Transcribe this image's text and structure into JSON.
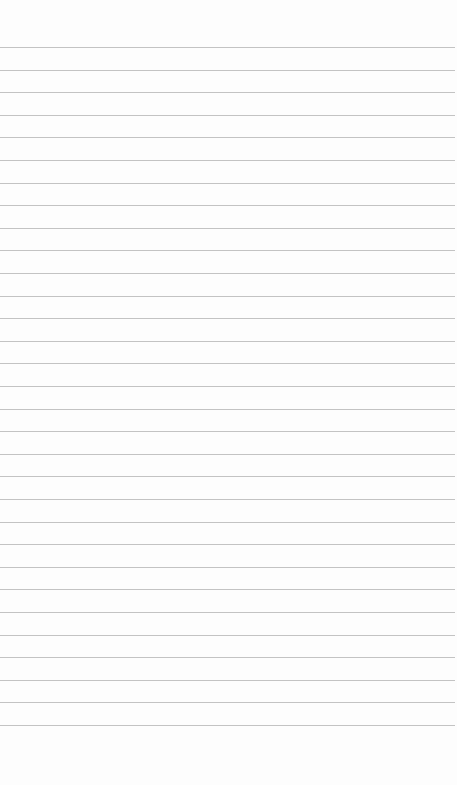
{
  "page": {
    "type": "ruled-notepad",
    "background_color": "#fdfdfd",
    "rule_color": "#b9b9b9",
    "rule_count": 31,
    "first_rule_y": 47,
    "rule_spacing": 22.6,
    "text_lines": []
  }
}
